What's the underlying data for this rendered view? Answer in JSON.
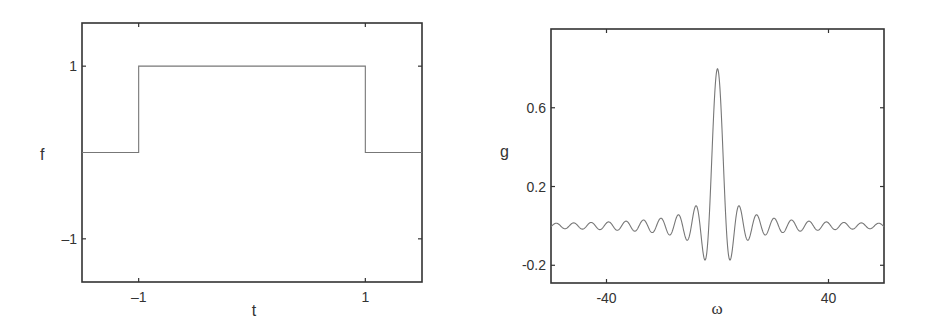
{
  "chart_data": [
    {
      "type": "line",
      "title": "",
      "xlabel": "t",
      "ylabel": "f",
      "xlim": [
        -1.5,
        1.5
      ],
      "ylim": [
        -1.5,
        1.5
      ],
      "grid": false,
      "legend": null,
      "xticks": [
        -1,
        1
      ],
      "xtick_labels": [
        "–1",
        "1"
      ],
      "yticks": [
        -1,
        1
      ],
      "ytick_labels": [
        "–1",
        "1"
      ],
      "description": "Rectangular pulse: f(t) = 1 for |t| < 1, 0 otherwise",
      "series": [
        {
          "name": "f(t)",
          "x": [
            -1.5,
            -1,
            -1,
            1,
            1,
            1.5
          ],
          "y": [
            0,
            0,
            1,
            1,
            0,
            0
          ]
        }
      ],
      "frame_px": {
        "left": 82,
        "top": 23,
        "right": 422,
        "bottom": 282
      },
      "label_px": {
        "ylabel": [
          40,
          160
        ],
        "xlabel": [
          254,
          316
        ]
      }
    },
    {
      "type": "line",
      "title": "",
      "xlabel": "ω",
      "ylabel": "g",
      "xlim": [
        -60,
        60
      ],
      "ylim": [
        -0.29,
        1.0
      ],
      "grid": false,
      "legend": null,
      "xticks": [
        -40,
        40
      ],
      "xtick_labels": [
        "-40",
        "40"
      ],
      "yticks": [
        -0.2,
        0.2,
        0.6
      ],
      "ytick_labels": [
        "-0.2",
        "0.2",
        "0.6"
      ],
      "description": "Fourier transform of the pulse: g(ω) = sqrt(2/π) · sin(ω)/ω (peak ≈ 0.80 at ω = 0, first minima ≈ -0.17 at ω ≈ ±4.5)",
      "formula": {
        "amplitude": 0.7979,
        "frequency": 1.0
      },
      "series": [
        {
          "name": "g(ω)",
          "x": [
            -60,
            -55,
            -50,
            -45,
            -40,
            -35,
            -30,
            -25,
            -20,
            -15,
            -10,
            -7.7,
            -4.5,
            -3.14,
            -2,
            -1,
            0,
            1,
            2,
            3.14,
            4.5,
            7.7,
            10,
            15,
            20,
            25,
            30,
            35,
            40,
            45,
            50,
            55,
            60
          ],
          "y": [
            0.004,
            -0.0014,
            -0.004,
            -0.015,
            -0.015,
            0.01,
            0.026,
            0.004,
            -0.036,
            -0.035,
            0.043,
            0.102,
            -0.173,
            0.0,
            0.363,
            0.671,
            0.798,
            0.671,
            0.363,
            0.0,
            -0.173,
            0.102,
            0.043,
            -0.035,
            -0.036,
            0.004,
            0.026,
            0.01,
            -0.015,
            -0.015,
            -0.004,
            -0.0014,
            0.004
          ]
        }
      ],
      "frame_px": {
        "left": 551,
        "top": 29,
        "right": 884,
        "bottom": 283
      },
      "label_px": {
        "ylabel": [
          500,
          157
        ],
        "xlabel": [
          717,
          314
        ]
      }
    }
  ]
}
